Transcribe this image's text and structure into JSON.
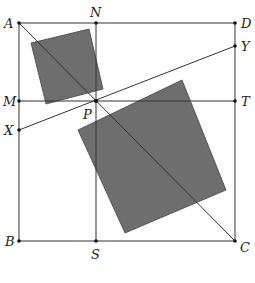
{
  "diagram": {
    "type": "geometry",
    "points": {
      "A": {
        "label": "A",
        "x": 19,
        "y": 23
      },
      "B": {
        "label": "B",
        "x": 19,
        "y": 241
      },
      "C": {
        "label": "C",
        "x": 235,
        "y": 241
      },
      "D": {
        "label": "D",
        "x": 235,
        "y": 23
      },
      "N": {
        "label": "N",
        "x": 96,
        "y": 23
      },
      "S": {
        "label": "S",
        "x": 96,
        "y": 241
      },
      "M": {
        "label": "M",
        "x": 19,
        "y": 101
      },
      "T": {
        "label": "T",
        "x": 235,
        "y": 101
      },
      "X": {
        "label": "X",
        "x": 19,
        "y": 130
      },
      "Y": {
        "label": "Y",
        "x": 235,
        "y": 46
      },
      "P": {
        "label": "P",
        "x": 96,
        "y": 101
      }
    },
    "segments": [
      "AD",
      "DC",
      "CB",
      "BA",
      "AC",
      "MT",
      "NS",
      "XY"
    ],
    "shaded_squares": [
      {
        "name": "small-square",
        "vertices": [
          [
            31,
            43
          ],
          [
            89,
            29
          ],
          [
            103,
            89
          ],
          [
            46,
            104
          ]
        ],
        "fill": "#6e6e6e"
      },
      {
        "name": "large-square",
        "vertices": [
          [
            78,
            130
          ],
          [
            182,
            80
          ],
          [
            226,
            190
          ],
          [
            125,
            233
          ]
        ],
        "fill": "#6e6e6e"
      }
    ]
  }
}
